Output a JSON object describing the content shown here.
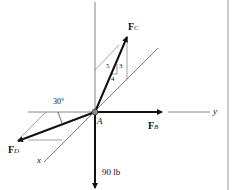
{
  "diagram": {
    "axes": {
      "z_label": "z",
      "y_label": "y",
      "x_label": "x"
    },
    "point": {
      "label": "A"
    },
    "forces": {
      "FB": {
        "main": "F",
        "sub": "B"
      },
      "FC": {
        "main": "F",
        "sub": "C"
      },
      "FD": {
        "main": "F",
        "sub": "D"
      },
      "weight": "90 lb"
    },
    "slope_triangle": {
      "hyp": "5",
      "vert": "3",
      "horiz": "4"
    },
    "angle": "30°",
    "colors": {
      "line": "#111111",
      "thin": "#555555",
      "border": "#bbbbbb"
    }
  }
}
